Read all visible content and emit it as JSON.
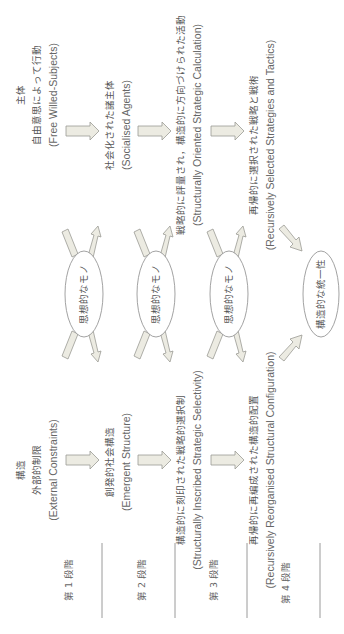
{
  "diagram": {
    "orientation": "rotated 90° counter-clockwise (text reads bottom-to-top)",
    "agency_column": {
      "heading": "主体",
      "items": [
        {
          "jp": "自由意思によって行動",
          "en": "(Free Willed-Subjects)"
        },
        {
          "jp": "社会化された諸主体",
          "en": "(Socialised Agents)"
        },
        {
          "jp": "戦略的に評量され，構造的に方向づけられた活動",
          "en": "(Structurally Oriented Strategic Calculation)"
        },
        {
          "jp": "再帰的に選択された戦略と戦術",
          "en": "(Recursively Selected Strategies and Tactics)"
        }
      ]
    },
    "structure_column": {
      "heading": "構造",
      "items": [
        {
          "jp": "外部的制限",
          "en": "(External Constraints)"
        },
        {
          "jp": "創発的社会構造",
          "en": "(Emergent Structure)"
        },
        {
          "jp": "構造的に刻印された戦略的選択制",
          "en": "(Structurally Inscribed Strategic Selectivity)"
        },
        {
          "jp": "再帰的に再編成された構造的配置",
          "en": "(Recursively Reorganised Structural Configuration)"
        }
      ]
    },
    "ideational_nodes": [
      {
        "label": "思想的なモノ"
      },
      {
        "label": "思想的なモノ"
      },
      {
        "label": "思想的なモノ"
      }
    ],
    "final_node": {
      "label": "構造的な統一性"
    },
    "stages": [
      {
        "label": "第 1 段階"
      },
      {
        "label": "第 2 段階"
      },
      {
        "label": "第 3 段階"
      },
      {
        "label": "第 4 段階"
      }
    ],
    "colors": {
      "arrow_fill": "#ecebe2",
      "arrow_stroke": "#9a9a94",
      "text": "#555555",
      "separator": "#9a9a9a"
    }
  }
}
